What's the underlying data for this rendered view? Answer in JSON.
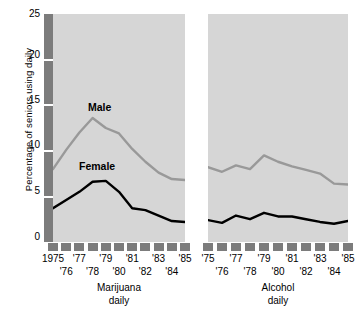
{
  "chart_data": {
    "type": "line",
    "title": "",
    "ylabel": "Percentage of seniors using daily",
    "xlabel": "",
    "ylim": [
      0,
      25
    ],
    "yticks": [
      0,
      5,
      10,
      15,
      20,
      25
    ],
    "grid": false,
    "legend_position": "inline-annotation",
    "x": [
      1975,
      1976,
      1977,
      1978,
      1979,
      1980,
      1981,
      1982,
      1983,
      1984,
      1985
    ],
    "xtick_labels_top": [
      "1975",
      "'77",
      "'79",
      "'81",
      "'83",
      "'85"
    ],
    "xtick_labels_bottom": [
      "'76",
      "'78",
      "'80",
      "'82",
      "'84"
    ],
    "panels": [
      {
        "name": "marijuana",
        "caption_line1": "Marijuana",
        "caption_line2": "daily",
        "xtick_labels_top": [
          "1975",
          "'77",
          "'79",
          "'81",
          "'83",
          "'85"
        ],
        "xtick_labels_bottom": [
          "'76",
          "'78",
          "'80",
          "'82",
          "'84"
        ],
        "series": [
          {
            "name": "Male",
            "color": "#999999",
            "label_text": "Male",
            "values": [
              8.0,
              10.1,
              12.0,
              13.6,
              12.5,
              11.9,
              10.2,
              8.8,
              7.6,
              6.9,
              6.8
            ]
          },
          {
            "name": "Female",
            "color": "#000000",
            "label_text": "Female",
            "values": [
              3.7,
              4.6,
              5.5,
              6.6,
              6.7,
              5.5,
              3.7,
              3.5,
              2.9,
              2.3,
              2.2
            ]
          }
        ]
      },
      {
        "name": "alcohol",
        "caption_line1": "Alcohol",
        "caption_line2": "daily",
        "xtick_labels_top": [
          "'75",
          "'77",
          "'79",
          "'81",
          "'83",
          "'85"
        ],
        "xtick_labels_bottom": [
          "'76",
          "'78",
          "'80",
          "'82",
          "'84"
        ],
        "series": [
          {
            "name": "Male",
            "color": "#999999",
            "label_text": "Male",
            "values": [
              8.2,
              7.7,
              8.4,
              8.0,
              9.5,
              8.8,
              8.3,
              7.9,
              7.5,
              6.4,
              6.3
            ]
          },
          {
            "name": "Female",
            "color": "#000000",
            "label_text": "Female",
            "values": [
              2.4,
              2.1,
              2.9,
              2.5,
              3.2,
              2.8,
              2.8,
              2.5,
              2.2,
              2.0,
              2.3
            ]
          }
        ]
      }
    ]
  },
  "axis": {
    "ytick_0": "0",
    "ytick_5": "5",
    "ytick_10": "10",
    "ytick_15": "15",
    "ytick_20": "20",
    "ytick_25": "25"
  },
  "colors": {
    "panel_background": "#d6d6d6",
    "axis_bar": "#7c7c7c",
    "male_line": "#999999",
    "female_line": "#000000",
    "page_background": "#ffffff"
  }
}
